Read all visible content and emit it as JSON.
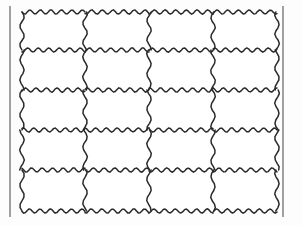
{
  "figure": {
    "name": "wavy-grid-table",
    "columns": 4,
    "rows": 5,
    "cell_count": 20,
    "cells": [
      {
        "row": 1,
        "col": 1,
        "text": ""
      },
      {
        "row": 1,
        "col": 2,
        "text": ""
      },
      {
        "row": 1,
        "col": 3,
        "text": ""
      },
      {
        "row": 1,
        "col": 4,
        "text": ""
      },
      {
        "row": 2,
        "col": 1,
        "text": ""
      },
      {
        "row": 2,
        "col": 2,
        "text": ""
      },
      {
        "row": 2,
        "col": 3,
        "text": ""
      },
      {
        "row": 2,
        "col": 4,
        "text": ""
      },
      {
        "row": 3,
        "col": 1,
        "text": ""
      },
      {
        "row": 3,
        "col": 2,
        "text": ""
      },
      {
        "row": 3,
        "col": 3,
        "text": ""
      },
      {
        "row": 3,
        "col": 4,
        "text": ""
      },
      {
        "row": 4,
        "col": 1,
        "text": ""
      },
      {
        "row": 4,
        "col": 2,
        "text": ""
      },
      {
        "row": 4,
        "col": 3,
        "text": ""
      },
      {
        "row": 4,
        "col": 4,
        "text": ""
      },
      {
        "row": 5,
        "col": 1,
        "text": ""
      },
      {
        "row": 5,
        "col": 2,
        "text": ""
      },
      {
        "row": 5,
        "col": 3,
        "text": ""
      },
      {
        "row": 5,
        "col": 4,
        "text": ""
      }
    ]
  },
  "geometry": {
    "canvas_width": 302,
    "canvas_height": 226,
    "grid_left": 22,
    "grid_right": 277,
    "grid_top": 12,
    "grid_bottom": 211,
    "column_x": [
      22,
      85,
      149,
      213,
      277
    ],
    "row_y": [
      12,
      50,
      90,
      130,
      170,
      211
    ],
    "frame_left_x": 10,
    "frame_right_x": 283,
    "frame_top_y": 6,
    "frame_bottom_y": 217,
    "h_wave_wavelength": 10.2,
    "h_wave_amplitude": 2.1,
    "v_wave_wavelength": 20.0,
    "v_wave_amplitude": 2.2
  },
  "colors": {
    "background": "#fdfdfd",
    "line": "#2a2a2a",
    "frame": "#555555",
    "cell_fill": "#ffffff"
  },
  "strokes": {
    "wavy_width": 1.5,
    "frame_width": 1.1
  }
}
